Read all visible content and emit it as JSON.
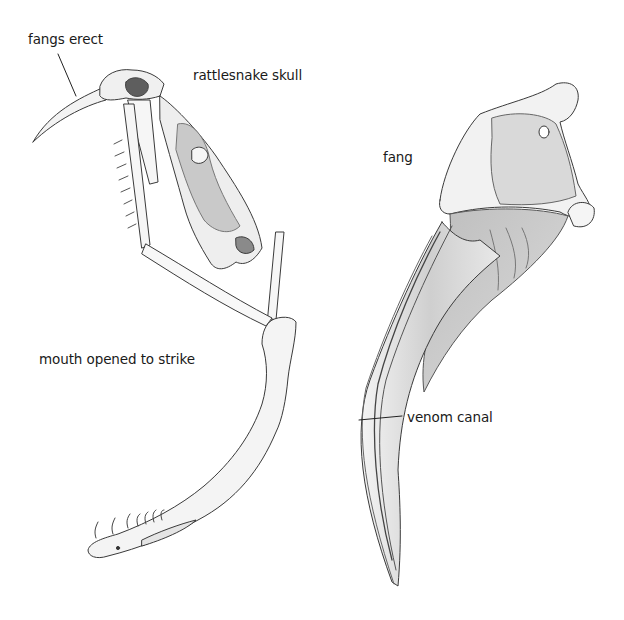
{
  "figure": {
    "background": "#ffffff",
    "ink_color": "#333333",
    "shade_light": "#e2e2e2",
    "shade_mid": "#c8c8c8",
    "shade_dark": "#6a6a6a"
  },
  "labels": {
    "fangs_erect": "fangs erect",
    "rattlesnake_skull": "rattlesnake skull",
    "mouth_opened": "mouth opened to strike",
    "fang": "fang",
    "venom_canal": "venom canal"
  },
  "illustrations": {
    "left": "rattlesnake-skull-open-jaw",
    "right": "fang-detail"
  }
}
